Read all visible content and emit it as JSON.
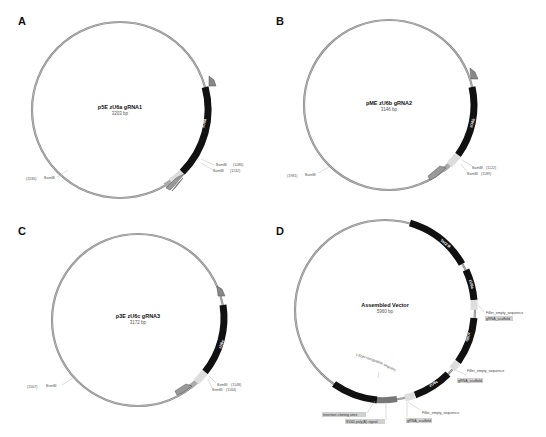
{
  "figure": {
    "panels": [
      {
        "letter": "A",
        "title": "p5E zU6a gRNA1",
        "size": "3203 bp",
        "promoter_label": "zU6a",
        "sites": [
          {
            "label": "BamBI",
            "pos": "(1086)"
          },
          {
            "label": "BamBI",
            "pos": "(1132)"
          },
          {
            "label": "BamBI",
            "pos": "(2036)"
          }
        ]
      },
      {
        "letter": "B",
        "title": "pME zU6b gRNA2",
        "size": "3146 bp",
        "promoter_label": "zU6b",
        "sites": [
          {
            "label": "BamBI",
            "pos": "(1122)"
          },
          {
            "label": "BamBI",
            "pos": "(1189)"
          },
          {
            "label": "BamBI",
            "pos": "(1981)"
          }
        ]
      },
      {
        "letter": "C",
        "title": "p3E zU6c gRNA3",
        "size": "3172 bp",
        "promoter_label": "zU6c",
        "sites": [
          {
            "label": "BsmBI",
            "pos": "(1148)"
          },
          {
            "label": "BsmBI",
            "pos": "(1164)"
          },
          {
            "label": "BsmBI",
            "pos": "(2007)"
          }
        ]
      },
      {
        "letter": "D",
        "title": "Assembled Vector",
        "size": "5960 bp",
        "segments": [
          "Tol2 R",
          "zU6a",
          "zU6b",
          "zU6c",
          "Tol2 L"
        ],
        "annotations": [
          "Filler_empty_sequence",
          "gRNA_scaffold",
          "Filler_empty_sequence",
          "gRNA_scaffold",
          "Filler_empty_sequence",
          "gRNA_scaffold",
          "I-SceI recognition sequence",
          "insertion cloning sites",
          "SV40 poly(A) signal"
        ]
      }
    ]
  }
}
